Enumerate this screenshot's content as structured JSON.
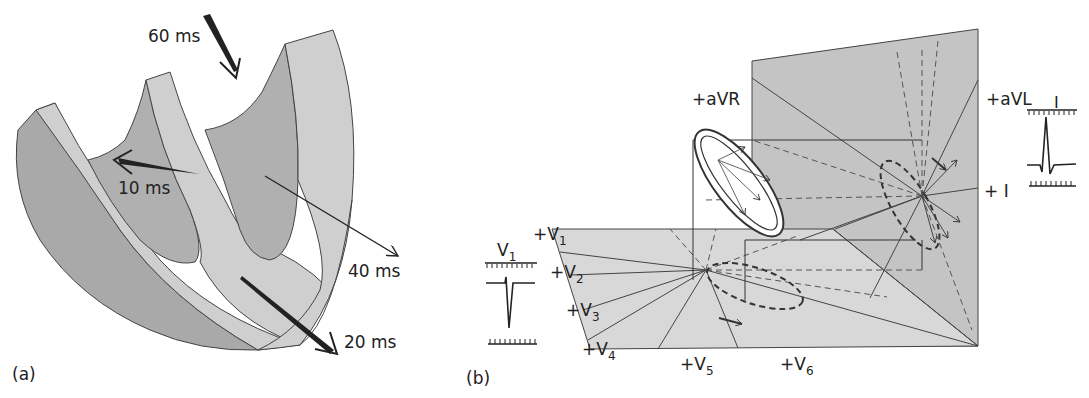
{
  "panel_a": {
    "label": "(a)",
    "arrows": [
      {
        "id": "t10",
        "label": "10 ms"
      },
      {
        "id": "t20",
        "label": "20 ms"
      },
      {
        "id": "t40",
        "label": "40 ms"
      },
      {
        "id": "t60",
        "label": "60 ms"
      }
    ]
  },
  "panel_b": {
    "label": "(b)",
    "frontal_leads": {
      "avr": "+aVR",
      "avl": "+aVL",
      "lead_i": "+ I"
    },
    "precordial_leads": {
      "v1": {
        "plus": "+",
        "base": "V",
        "sub": "1"
      },
      "v2": {
        "plus": "+",
        "base": "V",
        "sub": "2"
      },
      "v3": {
        "plus": "+",
        "base": "V",
        "sub": "3"
      },
      "v4": {
        "plus": "+",
        "base": "V",
        "sub": "4"
      },
      "v5": {
        "plus": "+",
        "base": "V",
        "sub": "5"
      },
      "v6": {
        "plus": "+",
        "base": "V",
        "sub": "6"
      }
    },
    "ecg_traces": {
      "v1": {
        "base": "V",
        "sub": "1"
      },
      "lead_i": {
        "label": "I"
      }
    }
  },
  "colors": {
    "dark_gray": "#a9a9a9",
    "light_gray": "#cfcfcf",
    "frontal_plane": "#c4c4c4",
    "horizontal_plane": "#d8d8d8",
    "line": "#333333"
  }
}
